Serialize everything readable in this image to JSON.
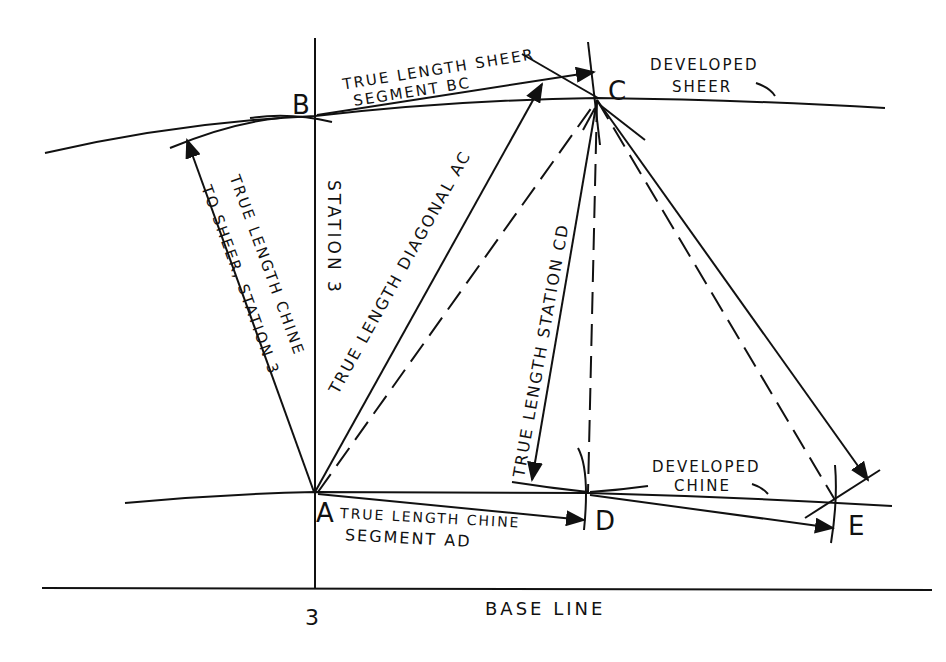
{
  "diagram": {
    "points": {
      "A": "A",
      "B": "B",
      "C": "C",
      "D": "D",
      "E": "E"
    },
    "labels": {
      "bc_line1": "TRUE LENGTH SHEER",
      "bc_line2": "SEGMENT BC",
      "developed_sheer_1": "DEVELOPED",
      "developed_sheer_2": "SHEER",
      "chine_sheer_1": "TRUE LENGTH CHINE",
      "chine_sheer_2": "TO SHEER, STATION 3",
      "station3_vertical": "STATION 3",
      "diagonal_ac": "TRUE LENGTH DIAGONAL AC",
      "station_cd": "TRUE LENGTH STATION CD",
      "developed_chine_1": "DEVELOPED",
      "developed_chine_2": "CHINE",
      "ad_line1": "TRUE LENGTH CHINE",
      "ad_line2": "SEGMENT AD",
      "station_number": "3",
      "base_line": "BASE LINE"
    }
  }
}
